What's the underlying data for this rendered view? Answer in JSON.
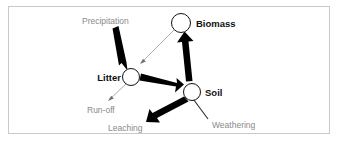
{
  "figure": {
    "background_color": "#ffffff",
    "frame_color": "#c9c9c9",
    "node_stroke_color": "#111111",
    "node_fill_color": "#ffffff",
    "major_flux_color": "#000000",
    "minor_flux_color": "#8a8a8a",
    "node_label_color": "#111111",
    "flux_label_color": "#8a8a8a"
  },
  "nodes": [
    {
      "id": "biomass",
      "label": "Biomass",
      "cx": 181,
      "cy": 23,
      "r": 9.5,
      "label_x": 196,
      "label_y": 19,
      "align": "left"
    },
    {
      "id": "litter",
      "label": "Litter",
      "cx": 131,
      "cy": 77,
      "r": 8.5,
      "label_x": 118,
      "label_y": 73,
      "align": "right"
    },
    {
      "id": "soil",
      "label": "Soil",
      "cx": 192,
      "cy": 92,
      "r": 8.5,
      "label_x": 205,
      "label_y": 88,
      "align": "left"
    }
  ],
  "fluxes": [
    {
      "id": "precipitation",
      "label": "Precipitation",
      "weight": "major",
      "from": "atmosphere",
      "to": "litter",
      "label_x": 82,
      "label_y": 17
    },
    {
      "id": "biomass-litter",
      "label": "",
      "weight": "minor",
      "from": "biomass",
      "to": "litter",
      "label_x": 0,
      "label_y": 0
    },
    {
      "id": "litter-soil",
      "label": "",
      "weight": "major",
      "from": "litter",
      "to": "soil",
      "label_x": 0,
      "label_y": 0
    },
    {
      "id": "soil-biomass",
      "label": "",
      "weight": "major",
      "from": "soil",
      "to": "biomass",
      "label_x": 0,
      "label_y": 0
    },
    {
      "id": "run-off",
      "label": "Run-off",
      "weight": "minor",
      "from": "litter",
      "to": "external",
      "label_x": 87,
      "label_y": 106
    },
    {
      "id": "leaching",
      "label": "Leaching",
      "weight": "major",
      "from": "soil",
      "to": "external",
      "label_x": 108,
      "label_y": 124
    },
    {
      "id": "weathering",
      "label": "Weathering",
      "weight": "minor",
      "from": "bedrock",
      "to": "soil",
      "label_x": 212,
      "label_y": 121
    }
  ]
}
